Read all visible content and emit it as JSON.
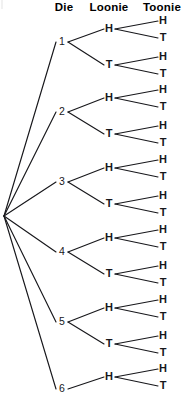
{
  "figure": {
    "kind": "probability-tree-diagram",
    "width": 183,
    "height": 407,
    "background_color": "#ffffff",
    "line_color": "#17171b",
    "text_color": "#17171b"
  },
  "headers": [
    {
      "label": "Die",
      "x": 64,
      "y": 11
    },
    {
      "label": "Loonie",
      "x": 109,
      "y": 11
    },
    {
      "label": "Toonie",
      "x": 162,
      "y": 11
    }
  ],
  "root": {
    "x": 4,
    "y": 216
  },
  "columns": {
    "die_x": 62,
    "loonie_x": 109,
    "toonie_x": 163,
    "die_node_x": 56,
    "loonie_node_x": 104,
    "toonie_node_x": 158
  },
  "chart_data": {
    "type": "tree",
    "title": "",
    "levels": [
      "Die",
      "Loonie",
      "Toonie"
    ],
    "level_outcomes": {
      "Die": [
        "1",
        "2",
        "3",
        "4",
        "5",
        "6"
      ],
      "Loonie": [
        "H",
        "T"
      ],
      "Toonie": [
        "H",
        "T"
      ]
    },
    "die_branches": [
      {
        "label": "1",
        "x": 62,
        "y": 45
      },
      {
        "label": "2",
        "x": 62,
        "y": 115
      },
      {
        "label": "3",
        "x": 62,
        "y": 185
      },
      {
        "label": "4",
        "x": 62,
        "y": 255
      },
      {
        "label": "5",
        "x": 62,
        "y": 325
      },
      {
        "label": "6",
        "x": 62,
        "y": 392
      }
    ],
    "loonie_branches": [
      {
        "label": "H",
        "x": 109,
        "y": 32,
        "die": "1"
      },
      {
        "label": "T",
        "x": 109,
        "y": 68,
        "die": "1"
      },
      {
        "label": "H",
        "x": 109,
        "y": 101,
        "die": "2"
      },
      {
        "label": "T",
        "x": 109,
        "y": 137,
        "die": "2"
      },
      {
        "label": "H",
        "x": 109,
        "y": 171,
        "die": "3"
      },
      {
        "label": "T",
        "x": 109,
        "y": 207,
        "die": "3"
      },
      {
        "label": "H",
        "x": 109,
        "y": 241,
        "die": "4"
      },
      {
        "label": "T",
        "x": 109,
        "y": 277,
        "die": "4"
      },
      {
        "label": "H",
        "x": 109,
        "y": 311,
        "die": "5"
      },
      {
        "label": "T",
        "x": 109,
        "y": 347,
        "die": "5"
      },
      {
        "label": "H",
        "x": 109,
        "y": 380,
        "die": "6"
      }
    ],
    "toonie_branches": [
      {
        "label": "H",
        "x": 163,
        "y": 24
      },
      {
        "label": "T",
        "x": 163,
        "y": 41
      },
      {
        "label": "H",
        "x": 163,
        "y": 60
      },
      {
        "label": "T",
        "x": 163,
        "y": 77
      },
      {
        "label": "H",
        "x": 163,
        "y": 93
      },
      {
        "label": "T",
        "x": 163,
        "y": 110
      },
      {
        "label": "H",
        "x": 163,
        "y": 129
      },
      {
        "label": "T",
        "x": 163,
        "y": 146
      },
      {
        "label": "H",
        "x": 163,
        "y": 163
      },
      {
        "label": "T",
        "x": 163,
        "y": 180
      },
      {
        "label": "H",
        "x": 163,
        "y": 199
      },
      {
        "label": "T",
        "x": 163,
        "y": 216
      },
      {
        "label": "H",
        "x": 163,
        "y": 233
      },
      {
        "label": "T",
        "x": 163,
        "y": 250
      },
      {
        "label": "H",
        "x": 163,
        "y": 269
      },
      {
        "label": "T",
        "x": 163,
        "y": 286
      },
      {
        "label": "H",
        "x": 163,
        "y": 303
      },
      {
        "label": "T",
        "x": 163,
        "y": 320
      },
      {
        "label": "H",
        "x": 163,
        "y": 339
      },
      {
        "label": "T",
        "x": 163,
        "y": 356
      },
      {
        "label": "H",
        "x": 163,
        "y": 372
      },
      {
        "label": "T",
        "x": 163,
        "y": 389
      }
    ],
    "notes": {
      "total_die_outcomes": 6,
      "visible_die_branches": 6,
      "visible_loonie_branches": 11,
      "visible_toonie_branches": 22,
      "clipped_at_bottom": true
    }
  }
}
